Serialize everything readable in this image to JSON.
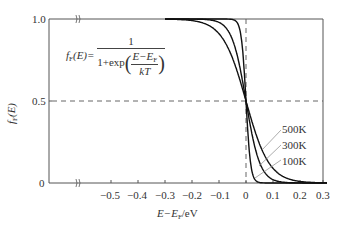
{
  "chart_data": {
    "type": "line",
    "title": "",
    "formula": {
      "lhs": "fF(E)=",
      "numerator": "1",
      "denominator_prefix": "1+exp",
      "inner_numerator": "E−EF",
      "inner_denominator": "kT"
    },
    "xlabel": "E−EF/eV",
    "ylabel": "fF(E)",
    "xlim": [
      -0.3,
      0.3
    ],
    "ylim": [
      0,
      1.0
    ],
    "x_ticks": [
      "-0.5",
      "-0.4",
      "-0.3",
      "-0.2",
      "-0.1",
      "0",
      "0.1",
      "0.2",
      "0.3"
    ],
    "x_tick_values": [
      -0.5,
      -0.4,
      -0.3,
      -0.2,
      -0.1,
      0,
      0.1,
      0.2,
      0.3
    ],
    "y_ticks": [
      "0",
      "0.5",
      "1.0"
    ],
    "y_tick_values": [
      0,
      0.5,
      1.0
    ],
    "axis_break": true,
    "reference_lines": [
      {
        "type": "horizontal",
        "y": 0.5,
        "style": "dashed"
      },
      {
        "type": "vertical",
        "x": 0,
        "style": "dashed"
      }
    ],
    "grid": false,
    "legend_position": "inline-annotations-right",
    "series": [
      {
        "name": "500K",
        "temperature_K": 500,
        "kT_eV": 0.0431
      },
      {
        "name": "300K",
        "temperature_K": 300,
        "kT_eV": 0.0259
      },
      {
        "name": "100K",
        "temperature_K": 100,
        "kT_eV": 0.00862
      }
    ],
    "annotations": [
      "500K",
      "300K",
      "100K"
    ]
  },
  "labels": {
    "y_tick_0": "0",
    "y_tick_05": "0.5",
    "y_tick_10": "1.0",
    "x_ticks": [
      "−0.5",
      "−0.4",
      "−0.3",
      "−0.2",
      "−0.1",
      "0",
      "0.1",
      "0.2",
      "0.3"
    ],
    "xlabel_main": "E−E",
    "xlabel_sub": "F",
    "xlabel_unit": "/eV",
    "ylabel_main": "f",
    "ylabel_sub": "F",
    "ylabel_arg": "(E)",
    "formula_f": "f",
    "formula_sub": "F",
    "formula_arg": "(E)=",
    "formula_num": "1",
    "formula_den_prefix": "1+exp",
    "formula_inner_num_main": "E−E",
    "formula_inner_num_sub": "F",
    "formula_inner_den": "kT",
    "legend_500": "500K",
    "legend_300": "300K",
    "legend_100": "100K"
  },
  "colors": {
    "axis": "#444444",
    "curve": "#111111",
    "dash": "#555555",
    "leader": "#888888"
  }
}
